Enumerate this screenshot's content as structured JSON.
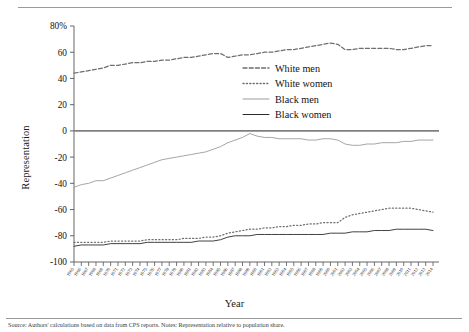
{
  "figure": {
    "caption": "Source: Authors' calculations based on data from CPS reports. Notes: Representation relative to population share."
  },
  "chart_data": {
    "type": "line",
    "title": "",
    "xlabel": "Year",
    "ylabel": "Representation",
    "ylim": [
      -100,
      80
    ],
    "yticks": [
      -100,
      -80,
      -60,
      -40,
      -20,
      0,
      20,
      40,
      60,
      80
    ],
    "ytick_labels": [
      "-100",
      "-80",
      "-60",
      "-40",
      "-20",
      "0",
      "20",
      "40",
      "60",
      "80%"
    ],
    "grid": false,
    "legend_position": "center-right",
    "zero_line": true,
    "x": [
      1965,
      1966,
      1967,
      1968,
      1969,
      1970,
      1971,
      1972,
      1973,
      1974,
      1975,
      1976,
      1977,
      1978,
      1979,
      1980,
      1981,
      1982,
      1983,
      1984,
      1985,
      1986,
      1987,
      1988,
      1989,
      1990,
      1991,
      1992,
      1993,
      1994,
      1995,
      1996,
      1997,
      1998,
      1999,
      2000,
      2001,
      2002,
      2003,
      2004,
      2005,
      2006,
      2007,
      2008,
      2009,
      2010,
      2011,
      2012,
      2013,
      2014
    ],
    "xtick_labels": [
      "1965",
      "1966",
      "1967",
      "1968",
      "1969",
      "1970",
      "1971",
      "1972",
      "1973",
      "1974",
      "1975",
      "1976",
      "1977",
      "1978",
      "1979",
      "1980",
      "1981",
      "1982",
      "1983",
      "1984",
      "1985",
      "1986",
      "1987",
      "1988",
      "1989",
      "1990",
      "1991",
      "1992",
      "1993",
      "1994",
      "1995",
      "1996",
      "1997",
      "1998",
      "1999",
      "2000",
      "2001",
      "2002",
      "2003",
      "2004",
      "2005",
      "2006",
      "2007",
      "2008",
      "2009",
      "2010",
      "2011",
      "2012",
      "2013",
      "2014"
    ],
    "series": [
      {
        "name": "White men",
        "style": "dashed",
        "color": "#6e6e6e",
        "values": [
          44,
          45,
          46,
          47,
          48,
          50,
          50,
          51,
          52,
          52,
          53,
          53,
          54,
          54,
          55,
          56,
          56,
          57,
          58,
          59,
          59,
          56,
          57,
          58,
          58,
          59,
          60,
          60,
          61,
          62,
          62,
          63,
          64,
          65,
          66,
          67,
          66,
          62,
          62,
          63,
          63,
          63,
          63,
          63,
          62,
          62,
          63,
          64,
          65,
          65
        ]
      },
      {
        "name": "White women",
        "style": "dotted",
        "color": "#6e6e6e",
        "values": [
          -85,
          -85,
          -85,
          -85,
          -85,
          -84,
          -84,
          -84,
          -84,
          -84,
          -83,
          -83,
          -83,
          -83,
          -83,
          -82,
          -82,
          -82,
          -81,
          -81,
          -80,
          -78,
          -77,
          -76,
          -75,
          -75,
          -74,
          -74,
          -73,
          -73,
          -72,
          -72,
          -71,
          -71,
          -70,
          -70,
          -70,
          -66,
          -64,
          -63,
          -62,
          -61,
          -60,
          -59,
          -59,
          -59,
          -59,
          -60,
          -61,
          -62
        ]
      },
      {
        "name": "Black men",
        "style": "solid",
        "color": "#9b9b9b",
        "values": [
          -43,
          -41,
          -40,
          -38,
          -38,
          -36,
          -34,
          -32,
          -30,
          -28,
          -26,
          -24,
          -22,
          -21,
          -20,
          -19,
          -18,
          -17,
          -16,
          -14,
          -12,
          -9,
          -7,
          -5,
          -2,
          -4,
          -5,
          -5,
          -6,
          -6,
          -6,
          -6,
          -7,
          -7,
          -6,
          -6,
          -7,
          -10,
          -11,
          -11,
          -10,
          -10,
          -9,
          -9,
          -9,
          -8,
          -8,
          -7,
          -7,
          -7
        ]
      },
      {
        "name": "Black women",
        "style": "solid",
        "color": "#2b2b2b",
        "values": [
          -88,
          -87,
          -87,
          -87,
          -87,
          -86,
          -86,
          -86,
          -86,
          -86,
          -85,
          -85,
          -85,
          -85,
          -85,
          -85,
          -85,
          -84,
          -84,
          -84,
          -83,
          -81,
          -80,
          -80,
          -80,
          -79,
          -79,
          -79,
          -79,
          -79,
          -79,
          -79,
          -79,
          -79,
          -79,
          -78,
          -78,
          -78,
          -77,
          -77,
          -77,
          -76,
          -76,
          -76,
          -75,
          -75,
          -75,
          -75,
          -75,
          -76
        ]
      }
    ]
  }
}
